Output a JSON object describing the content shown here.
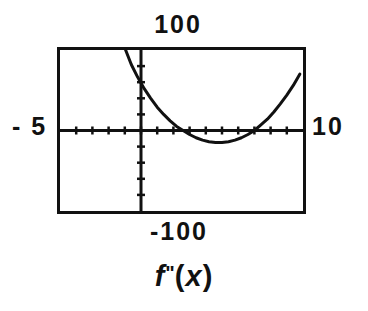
{
  "graph": {
    "caption_function": "f",
    "caption_prime": "\"",
    "caption_open": "(",
    "caption_var": "x",
    "caption_close": ")",
    "caption_full": "f\"(x)",
    "window": {
      "xmin_label": "- 5",
      "xmax_label": "10",
      "ymin_label": "-100",
      "ymax_label": "100"
    },
    "colors": {
      "ink": "#111111",
      "background": "#ffffff"
    }
  },
  "chart_data": {
    "type": "line",
    "title": "f\"(x)",
    "xlabel": "",
    "ylabel": "",
    "xlim": [
      -5,
      10
    ],
    "ylim": [
      -100,
      100
    ],
    "xscl": 1,
    "yscl": 20,
    "grid": false,
    "legend": false,
    "axes": {
      "x_axis_at_y": 0,
      "y_axis_at_x": 0,
      "x_tick_interval": 1,
      "y_tick_interval": 20
    },
    "series": [
      {
        "name": "f\"(x)",
        "x": [
          -0.95,
          -0.6,
          -0.2,
          0.2,
          0.6,
          1.0,
          1.4,
          1.8,
          2.2,
          2.6,
          3.0,
          3.4,
          3.8,
          4.2,
          4.6,
          5.0,
          5.4,
          5.8,
          6.2,
          6.6,
          7.0,
          7.4,
          7.8,
          8.2,
          8.6,
          9.0,
          9.4,
          9.8
        ],
        "y": [
          100,
          82,
          66,
          52,
          40,
          29,
          20,
          12,
          5,
          0,
          -5,
          -9,
          -12,
          -14,
          -15,
          -15,
          -14,
          -12,
          -9,
          -5,
          0,
          7,
          14,
          23,
          33,
          44,
          56,
          70
        ]
      }
    ],
    "annotations": [
      {
        "text": "100",
        "position": "above-top-of-window"
      },
      {
        "text": "-100",
        "position": "below-bottom-of-window"
      },
      {
        "text": "- 5",
        "position": "left-of-window"
      },
      {
        "text": "10",
        "position": "right-of-window"
      }
    ]
  }
}
